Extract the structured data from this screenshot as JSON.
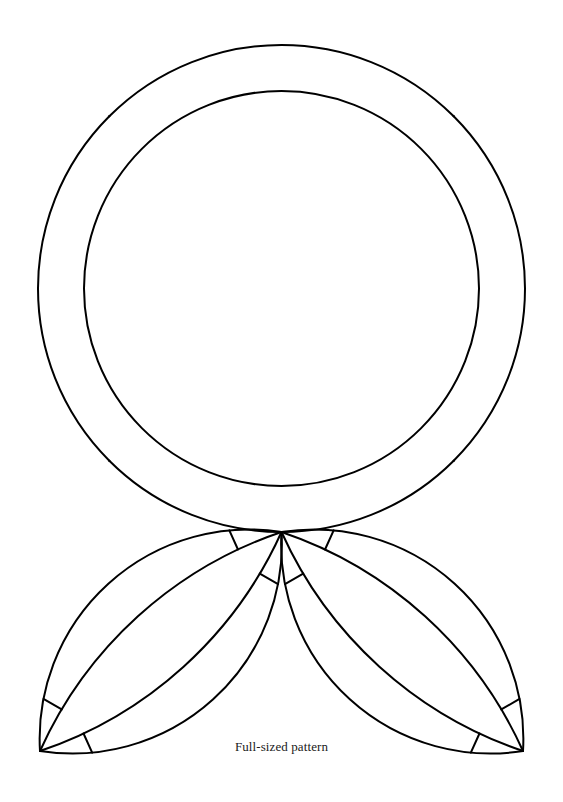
{
  "page": {
    "width": 563,
    "height": 802,
    "background_color": "#ffffff",
    "ink_color": "#000000",
    "stroke_width": 2
  },
  "caption": {
    "text": "Full-sized pattern",
    "x": 281,
    "y": 748,
    "font_size": 13,
    "color": "#1a1a1a"
  },
  "pattern": {
    "name": "double-wedding-ring-quilt-template",
    "title": "Full-sized pattern",
    "description": "Double Wedding Ring quilting template: a central ring with four melon-shaped arc bands and two pendant lobes below.",
    "geometry": {
      "main_circle": {
        "cx": 281.5,
        "cy": 288.5,
        "r": 243.5
      },
      "lens_band_inner_offset": 46,
      "neighbor_circle_distance": 487,
      "convergence_points": [
        {
          "name": "top",
          "x": 281.5,
          "y": 45
        },
        {
          "name": "left",
          "x": 38,
          "y": 288.5
        },
        {
          "name": "right",
          "x": 525,
          "y": 288.5
        },
        {
          "name": "bottom",
          "x": 281.5,
          "y": 532
        }
      ],
      "lobe_tips": [
        {
          "name": "bottom-left-tip",
          "x": 40,
          "y": 751
        },
        {
          "name": "bottom-right-tip",
          "x": 523,
          "y": 751
        }
      ]
    },
    "segments": [
      {
        "id": "outer-ring",
        "label": "outer ring circle"
      },
      {
        "id": "inner-ring",
        "label": "inner ring circle"
      },
      {
        "id": "melon-top-left",
        "label": "top-left melon band"
      },
      {
        "id": "melon-top-right",
        "label": "top-right melon band"
      },
      {
        "id": "melon-bottom-left",
        "label": "bottom-left melon band"
      },
      {
        "id": "melon-bottom-right",
        "label": "bottom-right melon band"
      },
      {
        "id": "lobe-bottom-left",
        "label": "bottom-left pendant lobe"
      },
      {
        "id": "lobe-bottom-right",
        "label": "bottom-right pendant lobe"
      },
      {
        "id": "divider-lines",
        "label": "seam divider lines"
      }
    ]
  }
}
